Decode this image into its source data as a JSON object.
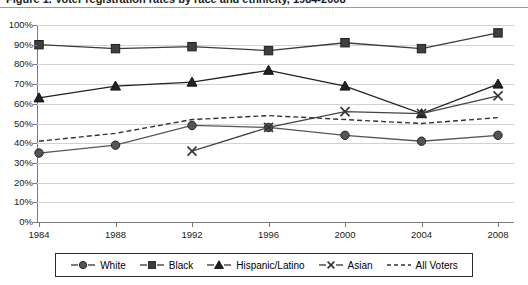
{
  "title": "Figure 1. Voter registration rates by race and ethnicity, 1984-2008",
  "chart_data": {
    "type": "line",
    "title": "Figure 1. Voter registration rates by race and ethnicity, 1984-2008",
    "xlabel": "",
    "ylabel": "",
    "categories": [
      "1984",
      "1988",
      "1992",
      "1996",
      "2000",
      "2004",
      "2008"
    ],
    "x": [
      1984,
      1988,
      1992,
      1996,
      2000,
      2004,
      2008
    ],
    "ylim": [
      0,
      100
    ],
    "ytick_labels": [
      "0%",
      "10%",
      "20%",
      "30%",
      "40%",
      "50%",
      "60%",
      "70%",
      "80%",
      "90%",
      "100%"
    ],
    "ytick_values": [
      0,
      10,
      20,
      30,
      40,
      50,
      60,
      70,
      80,
      90,
      100
    ],
    "grid": true,
    "legend_position": "bottom",
    "series": [
      {
        "name": "White",
        "marker": "circle",
        "line_style": "solid",
        "color": "#555555",
        "values": [
          35,
          39,
          49,
          48,
          44,
          41,
          44
        ]
      },
      {
        "name": "Black",
        "marker": "square",
        "line_style": "solid",
        "color": "#3a3a3a",
        "values": [
          90,
          88,
          89,
          87,
          91,
          88,
          96
        ]
      },
      {
        "name": "Hispanic/Latino",
        "marker": "triangle",
        "line_style": "solid",
        "color": "#222222",
        "values": [
          63,
          69,
          71,
          77,
          69,
          55,
          70
        ]
      },
      {
        "name": "Asian",
        "marker": "x",
        "line_style": "solid",
        "color": "#444444",
        "values": [
          null,
          null,
          36,
          48,
          56,
          55,
          64
        ]
      },
      {
        "name": "All Voters",
        "marker": "none",
        "line_style": "dashed",
        "color": "#333333",
        "values": [
          41,
          45,
          52,
          54,
          52,
          50,
          53
        ]
      }
    ]
  },
  "legend": {
    "items": [
      {
        "label": "White",
        "icon": "circle-marker-icon"
      },
      {
        "label": "Black",
        "icon": "square-marker-icon"
      },
      {
        "label": "Hispanic/Latino",
        "icon": "triangle-marker-icon"
      },
      {
        "label": "Asian",
        "icon": "x-marker-icon"
      },
      {
        "label": "All Voters",
        "icon": "dashed-line-icon"
      }
    ]
  },
  "colors": {
    "grid": "#d2d2d2",
    "axis": "#7a7a7a",
    "plot_background": "#ffffff",
    "text": "#1a1a1a"
  }
}
